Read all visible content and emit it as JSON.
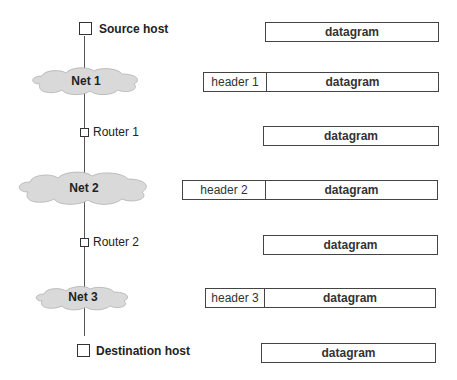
{
  "nodes": {
    "source": "Source host",
    "router1": "Router 1",
    "router2": "Router 2",
    "destination": "Destination host"
  },
  "networks": [
    "Net 1",
    "Net 2",
    "Net 3"
  ],
  "packets": [
    {
      "header": null,
      "body": "datagram"
    },
    {
      "header": "header 1",
      "body": "datagram"
    },
    {
      "header": null,
      "body": "datagram"
    },
    {
      "header": "header 2",
      "body": "datagram"
    },
    {
      "header": null,
      "body": "datagram"
    },
    {
      "header": "header 3",
      "body": "datagram"
    },
    {
      "header": null,
      "body": "datagram"
    }
  ],
  "colors": {
    "cloud_fill": "#d9d9d9",
    "line": "#555555",
    "box_border": "#444444"
  }
}
